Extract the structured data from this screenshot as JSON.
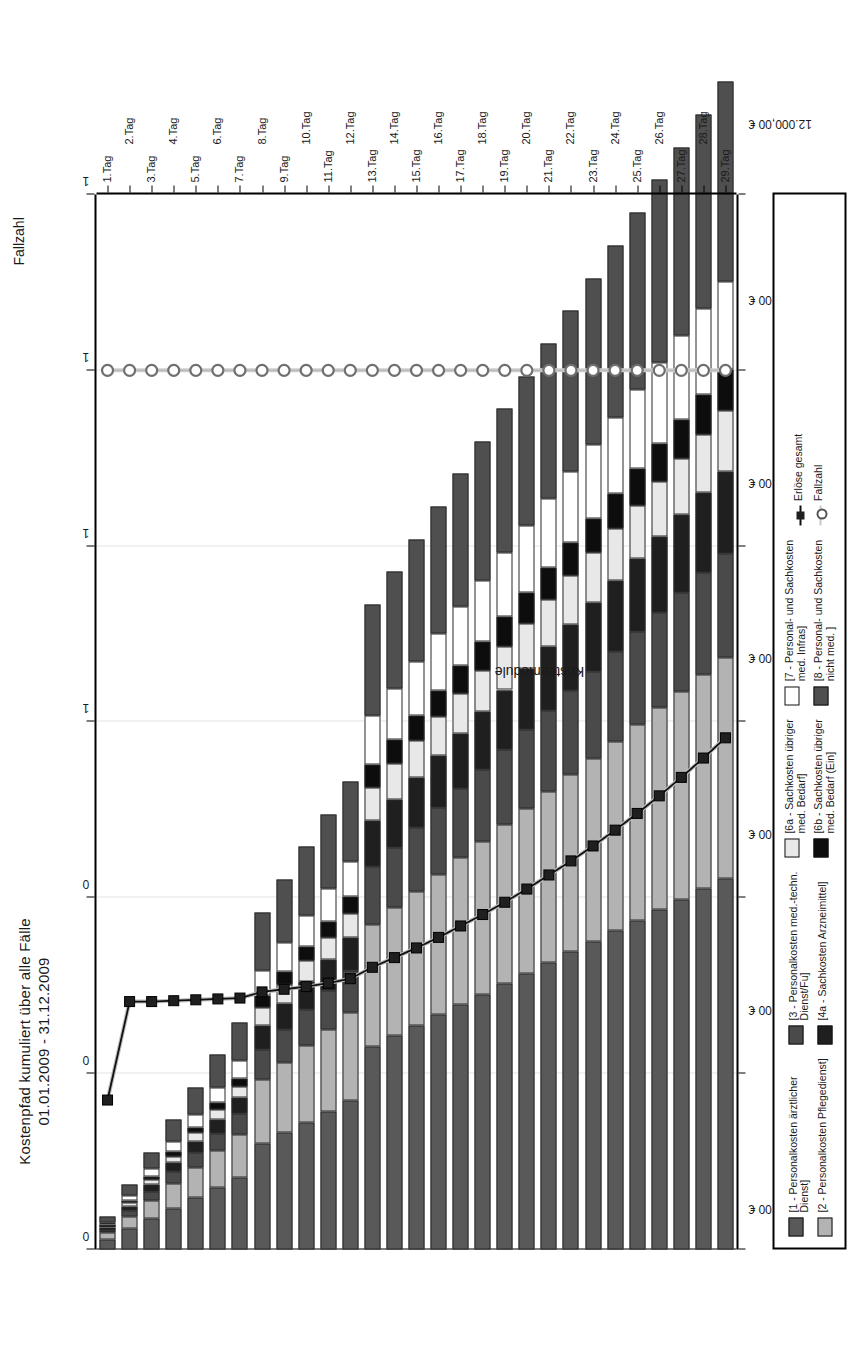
{
  "chart_data": {
    "type": "bar",
    "orientation": "horizontal",
    "stacked": true,
    "title": "Kostenpfad kumuliert über alle Fälle",
    "subtitle": "01.01.2009 - 31.12.2009",
    "xlabel": "Tage",
    "ylabel": "Kostenmodule",
    "secondary_axis_title": "Fallzahl",
    "grid": true,
    "legend_position": "bottom",
    "value_axis": {
      "ticks": [
        "0,00 €",
        "2.000,00 €",
        "4.000,00 €",
        "6.000,00 €",
        "8.000,00 €",
        "10.000,00 €",
        "12.000,00 €"
      ],
      "values": [
        0,
        2000,
        4000,
        6000,
        8000,
        10000,
        12000
      ],
      "min": 0,
      "max": 12000,
      "unit": "€"
    },
    "secondary_value_axis": {
      "ticks": [
        "0",
        "0",
        "0",
        "1",
        "1",
        "1",
        "1"
      ],
      "values": [
        0,
        20,
        40,
        60,
        80,
        100,
        120
      ],
      "min": 0,
      "max": 120
    },
    "categories": [
      "1.Tag",
      "2.Tag",
      "3.Tag",
      "4.Tag",
      "5.Tag",
      "6.Tag",
      "7.Tag",
      "8.Tag",
      "9.Tag",
      "10.Tag",
      "11.Tag",
      "12.Tag",
      "13.Tag",
      "14.Tag",
      "15.Tag",
      "16.Tag",
      "17.Tag",
      "18.Tag",
      "19.Tag",
      "20.Tag",
      "21.Tag",
      "22.Tag",
      "23.Tag",
      "24.Tag",
      "25.Tag",
      "26.Tag",
      "27.Tag",
      "28.Tag",
      "29.Tag"
    ],
    "series": [
      {
        "name": "[1 - Personalkosten ärztlicher Dienst]",
        "key": "s1",
        "color": "#595959",
        "values": [
          118,
          236,
          352,
          470,
          588,
          706,
          822,
          1210,
          1330,
          1450,
          1570,
          1690,
          2310,
          2430,
          2550,
          2670,
          2790,
          2905,
          3025,
          3145,
          3265,
          3385,
          3505,
          3625,
          3745,
          3865,
          3985,
          4105,
          4225
        ]
      },
      {
        "name": "[2 - Personalkosten Pflegedienst]",
        "key": "s2",
        "color": "#b3b3b3",
        "values": [
          70,
          140,
          210,
          280,
          350,
          420,
          490,
          725,
          795,
          865,
          935,
          1005,
          1385,
          1455,
          1525,
          1595,
          1665,
          1735,
          1805,
          1875,
          1945,
          2015,
          2085,
          2155,
          2225,
          2295,
          2365,
          2435,
          2505
        ]
      },
      {
        "name": "[3 - Personalkosten med.-techn. Dienst/Fu]",
        "key": "s3",
        "color": "#4a4a4a",
        "values": [
          33,
          66,
          99,
          132,
          165,
          198,
          231,
          345,
          378,
          411,
          444,
          477,
          660,
          693,
          726,
          759,
          792,
          825,
          858,
          891,
          924,
          957,
          990,
          1023,
          1056,
          1089,
          1122,
          1155,
          1188
        ]
      },
      {
        "name": "[4a - Sachkosten Arzneimittel]",
        "key": "s4a",
        "color": "#1f1f1f",
        "values": [
          26,
          52,
          78,
          104,
          130,
          156,
          182,
          272,
          298,
          324,
          350,
          376,
          520,
          546,
          572,
          598,
          624,
          650,
          676,
          702,
          728,
          754,
          780,
          806,
          832,
          858,
          884,
          910,
          936
        ]
      },
      {
        "name": "[6a - Sachkosten übriger med. Bedarf]",
        "key": "s6a",
        "color": "#e8e8e8",
        "values": [
          19,
          38,
          57,
          76,
          95,
          114,
          133,
          198,
          217,
          236,
          255,
          274,
          380,
          399,
          418,
          437,
          456,
          475,
          494,
          513,
          532,
          551,
          570,
          589,
          608,
          627,
          646,
          665,
          684
        ]
      },
      {
        "name": "[6b - Sachkosten übriger med. Bedarf (Ein]",
        "key": "s6b",
        "color": "#0d0d0d",
        "values": [
          13,
          26,
          39,
          52,
          65,
          78,
          91,
          136,
          149,
          162,
          175,
          188,
          260,
          273,
          286,
          299,
          312,
          325,
          338,
          351,
          364,
          377,
          390,
          403,
          416,
          429,
          442,
          455,
          468
        ]
      },
      {
        "name": "[7 - Personal- und Sachkosten med. Infras]",
        "key": "s7",
        "color": "#ffffff",
        "values": [
          28,
          56,
          84,
          112,
          140,
          168,
          196,
          292,
          320,
          348,
          376,
          404,
          560,
          588,
          616,
          644,
          672,
          700,
          728,
          756,
          784,
          812,
          840,
          868,
          896,
          924,
          952,
          980,
          1008
        ]
      },
      {
        "name": "[8 - Personal- und Sachkosten nicht med. ]",
        "key": "s8",
        "color": "#4f4f4f",
        "values": [
          63,
          126,
          189,
          252,
          315,
          378,
          441,
          657,
          720,
          783,
          846,
          909,
          1260,
          1323,
          1386,
          1449,
          1512,
          1575,
          1638,
          1701,
          1764,
          1827,
          1890,
          1953,
          2016,
          2079,
          2142,
          2205,
          2268
        ]
      }
    ],
    "line_series": [
      {
        "name": "Erlöse gesamt",
        "key": "erloese",
        "marker": "square",
        "color": "#1f1f1f",
        "axis": "primary",
        "values": [
          1700,
          2820,
          2820,
          2830,
          2840,
          2850,
          2860,
          2930,
          2960,
          2990,
          3030,
          3080,
          3210,
          3320,
          3430,
          3550,
          3680,
          3810,
          3950,
          4100,
          4260,
          4420,
          4590,
          4770,
          4960,
          5160,
          5370,
          5590,
          5820
        ]
      },
      {
        "name": "Fallzahl",
        "key": "fallzahl",
        "marker": "circle",
        "color": "#9a9a9a",
        "axis": "secondary",
        "values": [
          100,
          100,
          100,
          100,
          100,
          100,
          100,
          100,
          100,
          100,
          100,
          100,
          100,
          100,
          100,
          100,
          100,
          100,
          100,
          100,
          100,
          100,
          100,
          100,
          100,
          100,
          100,
          100,
          100
        ]
      }
    ],
    "legend_entries": [
      {
        "label": "[1 - Personalkosten ärztlicher\nDienst]",
        "swatch": "#595959",
        "type": "swatch"
      },
      {
        "label": "[2 - Personalkosten Pflegedienst]",
        "swatch": "#b3b3b3",
        "type": "swatch"
      },
      {
        "label": "[3 - Personalkosten med.-techn.\nDienst/Fu]",
        "swatch": "#4a4a4a",
        "type": "swatch"
      },
      {
        "label": "[4a - Sachkosten Arzneimittel]",
        "swatch": "#1f1f1f",
        "type": "swatch"
      },
      {
        "label": "[6a - Sachkosten übriger\nmed. Bedarf]",
        "swatch": "#e8e8e8",
        "type": "swatch"
      },
      {
        "label": "[6b - Sachkosten übriger\nmed. Bedarf (Ein]",
        "swatch": "#0d0d0d",
        "type": "swatch"
      },
      {
        "label": "[7 - Personal- und Sachkosten\nmed. Infras]",
        "swatch": "#ffffff",
        "type": "swatch"
      },
      {
        "label": "[8 - Personal- und Sachkosten\nnicht med. ]",
        "swatch": "#4f4f4f",
        "type": "swatch"
      },
      {
        "label": "Erlöse gesamt",
        "swatch": "#1f1f1f",
        "type": "line-square"
      },
      {
        "label": "Fallzahl",
        "swatch": "#9a9a9a",
        "type": "line-circle"
      }
    ]
  }
}
